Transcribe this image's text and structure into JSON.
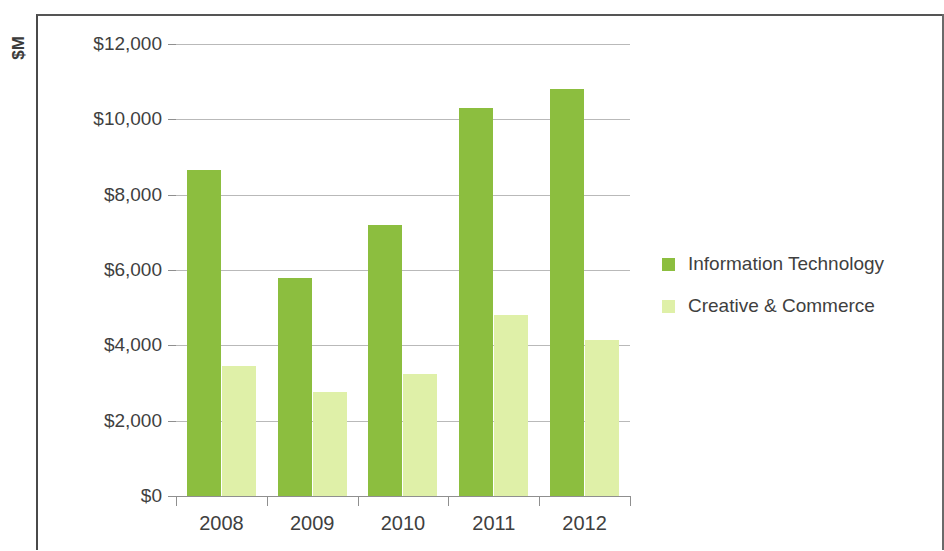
{
  "chart_data": {
    "type": "bar",
    "title": "",
    "xlabel": "",
    "ylabel": "$M",
    "categories": [
      "2008",
      "2009",
      "2010",
      "2011",
      "2012"
    ],
    "series": [
      {
        "name": "Information Technology",
        "color": "#8cbe3f",
        "values": [
          8650,
          5800,
          7200,
          10300,
          10800
        ]
      },
      {
        "name": "Creative & Commerce",
        "color": "#dff0a8",
        "values": [
          3450,
          2750,
          3250,
          4800,
          4150
        ]
      }
    ],
    "ylim": [
      0,
      12000
    ],
    "ytick_values": [
      0,
      2000,
      4000,
      6000,
      8000,
      10000,
      12000
    ],
    "ytick_labels": [
      "$0",
      "$2,000",
      "$4,000",
      "$6,000",
      "$8,000",
      "$10,000",
      "$12,000"
    ],
    "grid": true,
    "legend_position": "right"
  },
  "legend": {
    "entries": [
      {
        "label": "Information Technology",
        "color": "#8cbe3f"
      },
      {
        "label": "Creative & Commerce",
        "color": "#dff0a8"
      }
    ]
  },
  "axis": {
    "y_title": "$M"
  }
}
